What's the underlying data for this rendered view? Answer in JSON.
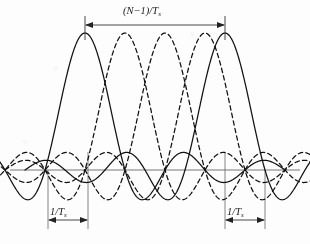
{
  "figure": {
    "kind": "ofdm-subcarrier-spectrum",
    "background_color": "#fdfdfd",
    "ink_color": "#111111",
    "axis_color": "#555555",
    "width": 310,
    "height": 244
  },
  "labels": {
    "bandwidth": {
      "prefix": "(",
      "symbol_n": "N",
      "minus_one": "−1",
      "suffix": ")/",
      "symbol_t": "T",
      "subscript": "s"
    },
    "spacing_left": {
      "numerator": "1/",
      "symbol_t": "T",
      "subscript": "s"
    },
    "spacing_right": {
      "numerator": "1/",
      "symbol_t": "T",
      "subscript": "s"
    }
  },
  "dimensions": [
    {
      "name": "total-bandwidth",
      "label": "(N-1)/Ts",
      "x_start": 85,
      "x_end": 225,
      "y_line": 25,
      "tick_top": 17,
      "tick_bottom": 33
    },
    {
      "name": "subcarrier-spacing-left",
      "label": "1/Ts",
      "x_start": 48,
      "x_end": 88,
      "y_line": 220,
      "tick_top": 212,
      "tick_bottom": 228
    },
    {
      "name": "subcarrier-spacing-right",
      "label": "1/Ts",
      "x_start": 225,
      "x_end": 265,
      "y_line": 220,
      "tick_top": 212,
      "tick_bottom": 228
    }
  ],
  "axis": {
    "name": "frequency-baseline",
    "y": 170,
    "x_start": 10,
    "x_end": 300
  },
  "leader_lines": [
    {
      "x": 48,
      "y_top": 170,
      "y_bottom": 228
    },
    {
      "x": 88,
      "y_top": 150,
      "y_bottom": 228
    },
    {
      "x": 225,
      "y_top": 150,
      "y_bottom": 228
    },
    {
      "x": 265,
      "y_top": 170,
      "y_bottom": 228
    },
    {
      "x": 85,
      "y_top": 17,
      "y_bottom": 40
    },
    {
      "x": 225,
      "y_top": 17,
      "y_bottom": 40
    }
  ],
  "chart_data": {
    "type": "line",
    "title": "",
    "xlabel": "",
    "ylabel": "",
    "zero_crossing_spacing_px": 40,
    "baseline_y_px": 170,
    "peak_amplitude_px": 137,
    "x_axis_unit": "1/Ts",
    "curves": [
      {
        "name": "subcarrier-1",
        "style": "solid",
        "peak_x": 85,
        "peak_y": 33,
        "lobes": 9
      },
      {
        "name": "subcarrier-2",
        "style": "dashed",
        "peak_x": 125,
        "peak_y": 33,
        "lobes": 9
      },
      {
        "name": "subcarrier-3",
        "style": "dashed",
        "peak_x": 165,
        "peak_y": 33,
        "lobes": 9
      },
      {
        "name": "subcarrier-4",
        "style": "dashed",
        "peak_x": 205,
        "peak_y": 33,
        "lobes": 9
      },
      {
        "name": "subcarrier-5",
        "style": "solid",
        "peak_x": 225,
        "peak_y": 33,
        "lobes": 9
      }
    ],
    "legend": [],
    "grid": false
  }
}
